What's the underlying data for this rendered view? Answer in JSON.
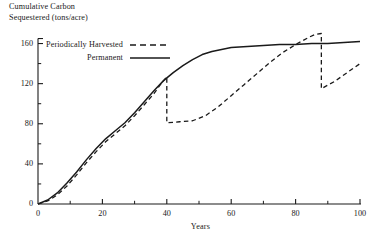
{
  "chart_data": {
    "type": "line",
    "title": "Cumulative Carbon\nSequestered (tons/acre)",
    "ylabel": "Cumulative Carbon Sequestered (tons/acre)",
    "xlabel": "Years",
    "xlim": [
      0,
      100
    ],
    "ylim": [
      0,
      170
    ],
    "grid": false,
    "legend_position": "top-left",
    "x_ticks": [
      "0",
      "20",
      "40",
      "60",
      "80",
      "100"
    ],
    "x_tick_values": [
      0,
      20,
      40,
      60,
      80,
      100
    ],
    "y_ticks": [
      "0",
      "40",
      "80",
      "120",
      "160"
    ],
    "y_tick_values": [
      0,
      40,
      80,
      120,
      160
    ],
    "x_minor_tick_values": [
      10,
      30,
      50,
      70,
      90
    ],
    "y_minor_tick_values": [
      20,
      60,
      100,
      140
    ],
    "series": [
      {
        "name": "Periodically Harvested",
        "style": "dashed",
        "color": "#1a1a1a",
        "points": [
          [
            0,
            0
          ],
          [
            3,
            3
          ],
          [
            6,
            9
          ],
          [
            9,
            18
          ],
          [
            12,
            29
          ],
          [
            15,
            41
          ],
          [
            18,
            52
          ],
          [
            21,
            62
          ],
          [
            24,
            70
          ],
          [
            27,
            78
          ],
          [
            30,
            88
          ],
          [
            33,
            99
          ],
          [
            36,
            110
          ],
          [
            38,
            119
          ],
          [
            40,
            127
          ],
          [
            40,
            81
          ],
          [
            44,
            82
          ],
          [
            48,
            83
          ],
          [
            52,
            88
          ],
          [
            56,
            97
          ],
          [
            60,
            108
          ],
          [
            64,
            119
          ],
          [
            68,
            130
          ],
          [
            72,
            141
          ],
          [
            76,
            151
          ],
          [
            80,
            159
          ],
          [
            84,
            166
          ],
          [
            86,
            169
          ],
          [
            88,
            170
          ],
          [
            88,
            115
          ],
          [
            92,
            122
          ],
          [
            96,
            131
          ],
          [
            100,
            140
          ]
        ]
      },
      {
        "name": "Permanent",
        "style": "solid",
        "color": "#1a1a1a",
        "points": [
          [
            0,
            0
          ],
          [
            3,
            4
          ],
          [
            6,
            11
          ],
          [
            9,
            21
          ],
          [
            12,
            32
          ],
          [
            15,
            44
          ],
          [
            18,
            55
          ],
          [
            21,
            65
          ],
          [
            24,
            73
          ],
          [
            27,
            81
          ],
          [
            30,
            91
          ],
          [
            33,
            102
          ],
          [
            36,
            113
          ],
          [
            39,
            123
          ],
          [
            42,
            131
          ],
          [
            45,
            138
          ],
          [
            48,
            144
          ],
          [
            51,
            149
          ],
          [
            54,
            152
          ],
          [
            57,
            154
          ],
          [
            60,
            156
          ],
          [
            65,
            157
          ],
          [
            70,
            158
          ],
          [
            75,
            159
          ],
          [
            80,
            159
          ],
          [
            85,
            160
          ],
          [
            90,
            160
          ],
          [
            95,
            161
          ],
          [
            100,
            162
          ]
        ]
      }
    ],
    "legend": [
      {
        "label": "Periodically Harvested",
        "style": "dashed"
      },
      {
        "label": "Permanent",
        "style": "solid"
      }
    ]
  }
}
